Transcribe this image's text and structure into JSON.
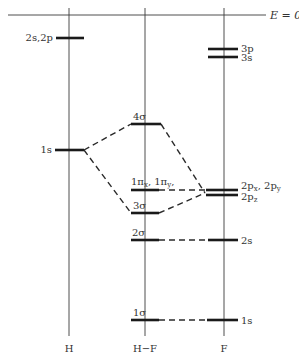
{
  "diagram": {
    "energy_zero_label": "E = 0",
    "columns": [
      {
        "id": "H",
        "label": "H",
        "x": 69
      },
      {
        "id": "HF",
        "label": "H−F",
        "x": 145
      },
      {
        "id": "F",
        "label": "F",
        "x": 224
      }
    ],
    "levels": {
      "H_2s2p": {
        "label": "2s,2p",
        "y": 38
      },
      "H_1s": {
        "label": "1s",
        "y": 150
      },
      "HF_4sigma": {
        "label": "4σ",
        "y": 124
      },
      "HF_1pi": {
        "label": "1πx, 1πy",
        "y": 190
      },
      "HF_3sigma": {
        "label": "3σ",
        "y": 213
      },
      "HF_2sigma": {
        "label": "2σ",
        "y": 240
      },
      "HF_1sigma": {
        "label": "1σ",
        "y": 320
      },
      "F_3p": {
        "label": "3p",
        "y": 49
      },
      "F_3s": {
        "label": "3s",
        "y": 57
      },
      "F_2pxy": {
        "label": "2px, 2py",
        "y": 190
      },
      "F_2pz": {
        "label": "2pz",
        "y": 195
      },
      "F_2s": {
        "label": "2s",
        "y": 240
      },
      "F_1s": {
        "label": "1s",
        "y": 320
      }
    },
    "labels": {
      "E0": "E = 0",
      "H_2s2p": "2s,2p",
      "H_1s": "1s",
      "sig4": "4σ",
      "pi1_a": "1π",
      "pi1_a_sub": "x",
      "pi1_b": "1π",
      "pi1_b_sub": "y",
      "sig3": "3σ",
      "sig2": "2σ",
      "sig1": "1σ",
      "F_3p": "3p",
      "F_3s": "3s",
      "F_2p": "2p",
      "F_2p_x": "x",
      "F_2p_y": "y",
      "F_2pz": "2p",
      "F_2pz_sub": "z",
      "F_2s": "2s",
      "F_1s": "1s",
      "col_H": "H",
      "col_HF": "H−F",
      "col_F": "F"
    }
  }
}
